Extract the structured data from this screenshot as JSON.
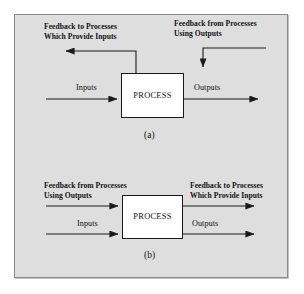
{
  "figure": {
    "background_color": "#dedede",
    "border_color": "#8a8a8a",
    "line_color": "#1a1a1a",
    "box_fill": "#ffffff"
  },
  "diagram_a": {
    "caption": "(a)",
    "process_label": "PROCESS",
    "input_label": "Inputs",
    "output_label": "Outputs",
    "feedback_left_line1": "Feedback to Processes",
    "feedback_left_line2": "Which Provide Inputs",
    "feedback_right_line1": "Feedback from Processes",
    "feedback_right_line2": "Using Outputs"
  },
  "diagram_b": {
    "caption": "(b)",
    "process_label": "PROCESS",
    "input_label": "Inputs",
    "output_label": "Outputs",
    "feedback_left_line1": "Feedback from Processes",
    "feedback_left_line2": "Using Outputs",
    "feedback_right_line1": "Feedback to Processes",
    "feedback_right_line2": "Which Provide Inputs"
  }
}
